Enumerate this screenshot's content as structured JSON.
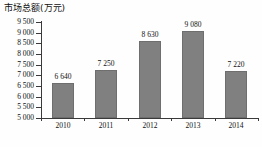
{
  "chart_data": {
    "type": "bar",
    "title": "市场总额(万元)",
    "xlabel": "",
    "ylabel": "",
    "categories": [
      "2010",
      "2011",
      "2012",
      "2013",
      "2014"
    ],
    "values": [
      6640,
      7250,
      8630,
      9080,
      7220
    ],
    "value_labels": [
      "6 640",
      "7 250",
      "8 630",
      "9 080",
      "7 220"
    ],
    "ylim": [
      5000,
      9500
    ],
    "ytick_step": 500,
    "ytick_labels": [
      "9 500",
      "9 000",
      "8 500",
      "8 000",
      "7 500",
      "7 000",
      "6 500",
      "6 000",
      "5 500",
      "5 000"
    ],
    "ytick_values": [
      9500,
      9000,
      8500,
      8000,
      7500,
      7000,
      6500,
      6000,
      5500,
      5000
    ],
    "grid": false,
    "legend": false,
    "bar_color": "#808080",
    "bar_edge_color": "#6e6e6e",
    "axis_color": "#3a3a3a",
    "background": "#fefefe"
  }
}
